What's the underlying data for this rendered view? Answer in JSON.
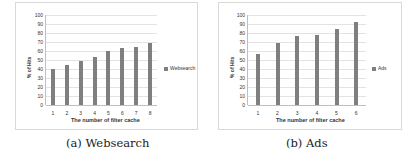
{
  "chart_data": [
    {
      "type": "bar",
      "title": "",
      "caption": "(a) Websearch",
      "categories": [
        "1",
        "2",
        "3",
        "4",
        "5",
        "6",
        "7",
        "8"
      ],
      "series": [
        {
          "name": "Websearch",
          "values": [
            40,
            44,
            49,
            53,
            60,
            63,
            65,
            69
          ]
        }
      ],
      "xlabel": "The number of filter cache",
      "ylabel": "% of Hits",
      "ylim": [
        0,
        100
      ],
      "yticks": [
        "0",
        "10",
        "20",
        "30",
        "40",
        "50",
        "60",
        "70",
        "80",
        "90",
        "100"
      ],
      "grid": true,
      "legend_position": "right",
      "color": "#7f7f7f"
    },
    {
      "type": "bar",
      "title": "",
      "caption": "(b) Ads",
      "categories": [
        "1",
        "2",
        "3",
        "4",
        "5",
        "6"
      ],
      "series": [
        {
          "name": "Ads",
          "values": [
            57,
            69,
            77,
            78,
            84,
            92
          ]
        }
      ],
      "xlabel": "The number of filter cache",
      "ylabel": "% of Hits",
      "ylim": [
        0,
        100
      ],
      "yticks": [
        "0",
        "10",
        "20",
        "30",
        "40",
        "50",
        "60",
        "70",
        "80",
        "90",
        "100"
      ],
      "grid": true,
      "legend_position": "right",
      "color": "#7f7f7f"
    }
  ]
}
